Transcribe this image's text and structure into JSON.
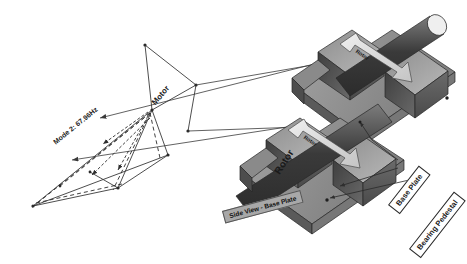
{
  "figure": {
    "type": "engineering-diagram",
    "background_color": "#ffffff",
    "line_color": "#333333",
    "palette": {
      "dark_gray": "#3d3d3d",
      "mid_gray": "#6e6e6e",
      "light_gray": "#9a9a9a",
      "pale_gray": "#bcbcbc",
      "edge": "#2a2a2a",
      "label_text": "#1a1a1a"
    }
  },
  "mode_shape": {
    "label": "Mode 2: 67.96Hz",
    "frequency_hz": 67.96,
    "mode_number": 2,
    "motor_label": "Motor",
    "undeformed_style": "solid",
    "deformed_style": "dashed"
  },
  "models": {
    "upper": {
      "rotor_arrow_label": "Rotor"
    },
    "lower": {
      "rotor_label": "Rotor",
      "rotor_arrow_label": "Rotor"
    }
  },
  "callouts": [
    {
      "id": "base-plate",
      "label": "Base Plate",
      "style": "boxed"
    },
    {
      "id": "bearing-pedestal",
      "label": "Bearing Pedestal",
      "style": "boxed"
    },
    {
      "id": "side-view",
      "label": "Side View - Base Plate",
      "style": "shaded"
    }
  ]
}
